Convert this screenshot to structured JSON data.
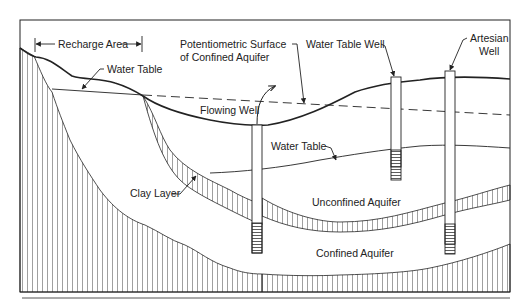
{
  "diagram": {
    "labels": {
      "recharge_area": "Recharge Area",
      "water_table_top": "Water Table",
      "potentiometric_1": "Potentiometric Surface",
      "potentiometric_2": "of Confined Aquifer",
      "water_table_well": "Water Table Well",
      "artesian_1": "Artesian",
      "artesian_2": "Well",
      "flowing_well": "Flowing Well",
      "water_table_mid": "Water Table",
      "clay_layer": "Clay Layer",
      "unconfined_aquifer": "Unconfined Aquifer",
      "confined_aquifer": "Confined Aquifer"
    },
    "colors": {
      "line": "#222222",
      "hatch": "#777777",
      "background": "#ffffff"
    }
  }
}
